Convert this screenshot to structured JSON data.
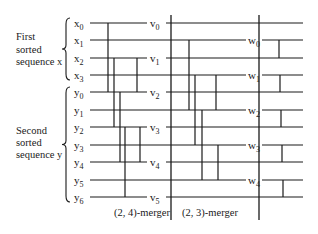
{
  "groups": {
    "first": {
      "lines": [
        "First",
        "sorted",
        "sequence x"
      ]
    },
    "second": {
      "lines": [
        "Second",
        "sorted",
        "sequence y"
      ]
    }
  },
  "inputs": [
    {
      "base": "x",
      "sub": "0",
      "y": 23
    },
    {
      "base": "x",
      "sub": "1",
      "y": 40
    },
    {
      "base": "x",
      "sub": "2",
      "y": 58
    },
    {
      "base": "x",
      "sub": "3",
      "y": 75
    },
    {
      "base": "y",
      "sub": "0",
      "y": 92
    },
    {
      "base": "y",
      "sub": "1",
      "y": 110
    },
    {
      "base": "y",
      "sub": "2",
      "y": 127
    },
    {
      "base": "y",
      "sub": "3",
      "y": 145
    },
    {
      "base": "y",
      "sub": "4",
      "y": 162
    },
    {
      "base": "y",
      "sub": "5",
      "y": 180
    },
    {
      "base": "y",
      "sub": "6",
      "y": 197
    }
  ],
  "v_outputs": [
    {
      "base": "v",
      "sub": "0",
      "y": 23
    },
    {
      "base": "v",
      "sub": "1",
      "y": 58
    },
    {
      "base": "v",
      "sub": "2",
      "y": 92
    },
    {
      "base": "v",
      "sub": "3",
      "y": 127
    },
    {
      "base": "v",
      "sub": "4",
      "y": 162
    },
    {
      "base": "v",
      "sub": "5",
      "y": 197
    }
  ],
  "w_outputs": [
    {
      "base": "w",
      "sub": "0",
      "y": 40
    },
    {
      "base": "w",
      "sub": "1",
      "y": 75
    },
    {
      "base": "w",
      "sub": "2",
      "y": 110
    },
    {
      "base": "w",
      "sub": "3",
      "y": 145
    },
    {
      "base": "w",
      "sub": "4",
      "y": 180
    }
  ],
  "mergers": {
    "left": {
      "label": "(2, 4)-merger"
    },
    "right": {
      "label": "(2, 3)-merger"
    }
  }
}
